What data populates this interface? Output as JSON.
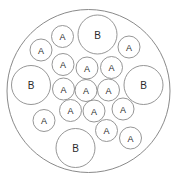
{
  "diagram": {
    "background_color": "#ffffff",
    "stroke_color": "#8a8a8a",
    "label_color": "#2b2b2b",
    "container": {
      "name": "container-circle",
      "cx": 88.5,
      "cy": 91,
      "r": 81.5
    },
    "legend": {
      "small_label": "A",
      "large_label": "B"
    },
    "counts": {
      "a_count": 18,
      "b_count": 4,
      "total": 22
    },
    "circles": [
      {
        "label": "B",
        "cx": 97.5,
        "cy": 34.5,
        "r": 19.5
      },
      {
        "label": "B",
        "cx": 31.0,
        "cy": 85.0,
        "r": 19.5
      },
      {
        "label": "B",
        "cx": 143.5,
        "cy": 85.0,
        "r": 19.5
      },
      {
        "label": "B",
        "cx": 75.5,
        "cy": 148.0,
        "r": 19.5
      },
      {
        "label": "A",
        "cx": 62.5,
        "cy": 36.5,
        "r": 11.0
      },
      {
        "label": "A",
        "cx": 41.0,
        "cy": 50.0,
        "r": 11.0
      },
      {
        "label": "A",
        "cx": 129.0,
        "cy": 47.0,
        "r": 11.0
      },
      {
        "label": "A",
        "cx": 63.0,
        "cy": 64.5,
        "r": 11.0
      },
      {
        "label": "A",
        "cx": 87.0,
        "cy": 68.0,
        "r": 11.0
      },
      {
        "label": "A",
        "cx": 111.5,
        "cy": 67.5,
        "r": 11.0
      },
      {
        "label": "A",
        "cx": 63.5,
        "cy": 89.0,
        "r": 11.0
      },
      {
        "label": "A",
        "cx": 86.0,
        "cy": 90.5,
        "r": 11.0
      },
      {
        "label": "A",
        "cx": 108.5,
        "cy": 90.0,
        "r": 11.0
      },
      {
        "label": "A",
        "cx": 70.5,
        "cy": 110.5,
        "r": 11.0
      },
      {
        "label": "A",
        "cx": 94.0,
        "cy": 111.0,
        "r": 11.0
      },
      {
        "label": "A",
        "cx": 123.0,
        "cy": 109.0,
        "r": 11.0
      },
      {
        "label": "A",
        "cx": 44.0,
        "cy": 120.5,
        "r": 11.0
      },
      {
        "label": "A",
        "cx": 106.5,
        "cy": 130.5,
        "r": 11.0
      },
      {
        "label": "A",
        "cx": 130.5,
        "cy": 138.0,
        "r": 11.0
      }
    ]
  }
}
